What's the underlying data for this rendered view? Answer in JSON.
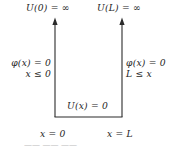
{
  "figure": {
    "type": "infinite-square-well-potential-diagram",
    "width": 177,
    "height": 146,
    "background_color": "#ffffff",
    "line_color": "#2b2b2b",
    "text_color": "#242424"
  },
  "labels": {
    "top_left": "U(0) = ∞",
    "top_right": "U(L) = ∞",
    "left_wavefunction": "φ(x) = 0",
    "left_region": "x ≤ 0",
    "right_wavefunction": "φ(x) = 0",
    "right_region": "L ≤ x",
    "inside_potential": "U(x) = 0",
    "axis_origin": "x = 0",
    "axis_length": "x = L"
  },
  "geometry": {
    "left_wall_x": 55,
    "right_wall_x": 122,
    "floor_y": 117,
    "wall_top_y": 18,
    "arrowhead": "up"
  },
  "caption_remnant": "——            ——  ——"
}
